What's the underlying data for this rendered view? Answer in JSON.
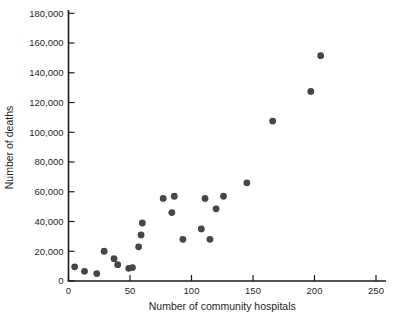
{
  "chart_data": {
    "type": "scatter",
    "title": "",
    "xlabel": "Number of community hospitals",
    "ylabel": "Number of deaths",
    "xlim": [
      0,
      257
    ],
    "ylim": [
      0,
      183000
    ],
    "grid": false,
    "legend": "none",
    "x_ticks": [
      {
        "value": 0,
        "label": "0"
      },
      {
        "value": 50,
        "label": "50"
      },
      {
        "value": 100,
        "label": "100"
      },
      {
        "value": 150,
        "label": "150"
      },
      {
        "value": 200,
        "label": "200"
      },
      {
        "value": 250,
        "label": "250"
      }
    ],
    "y_ticks": [
      {
        "value": 0,
        "label": "0"
      },
      {
        "value": 20000,
        "label": "20,000"
      },
      {
        "value": 40000,
        "label": "40,000"
      },
      {
        "value": 60000,
        "label": "60,000"
      },
      {
        "value": 80000,
        "label": "80,000"
      },
      {
        "value": 100000,
        "label": "100,000"
      },
      {
        "value": 120000,
        "label": "120,000"
      },
      {
        "value": 140000,
        "label": "140,000"
      },
      {
        "value": 160000,
        "label": "160,000"
      },
      {
        "value": 180000,
        "label": "180,000"
      }
    ],
    "points": [
      {
        "x": 5,
        "y": 9500
      },
      {
        "x": 13,
        "y": 6500
      },
      {
        "x": 23,
        "y": 5000
      },
      {
        "x": 29,
        "y": 20000
      },
      {
        "x": 37,
        "y": 15000
      },
      {
        "x": 40,
        "y": 11000
      },
      {
        "x": 49,
        "y": 8500
      },
      {
        "x": 52,
        "y": 9000
      },
      {
        "x": 57,
        "y": 23000
      },
      {
        "x": 59,
        "y": 31000
      },
      {
        "x": 60,
        "y": 39000
      },
      {
        "x": 77,
        "y": 55500
      },
      {
        "x": 84,
        "y": 46000
      },
      {
        "x": 86,
        "y": 57000
      },
      {
        "x": 93,
        "y": 28000
      },
      {
        "x": 108,
        "y": 35000
      },
      {
        "x": 111,
        "y": 55500
      },
      {
        "x": 115,
        "y": 28000
      },
      {
        "x": 120,
        "y": 48500
      },
      {
        "x": 126,
        "y": 57000
      },
      {
        "x": 145,
        "y": 66000
      },
      {
        "x": 166,
        "y": 107500
      },
      {
        "x": 197,
        "y": 127500
      },
      {
        "x": 205,
        "y": 151500
      }
    ],
    "point_color": "#464646",
    "axis_color": "#1a1a1a",
    "tick_label_color": "#1f1f1f",
    "background_color": "#ffffff"
  }
}
